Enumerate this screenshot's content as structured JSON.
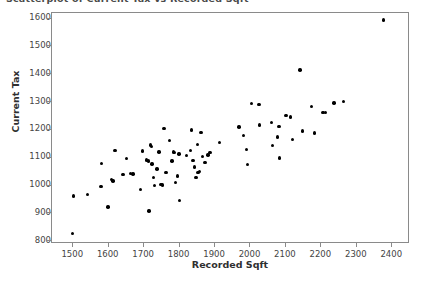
{
  "chart_data": {
    "type": "scatter",
    "title": "Scatterplot of Current Tax vs Recorded Sqft",
    "xlabel": "Recorded Sqft",
    "ylabel": "Current Tax",
    "xlim": [
      1440,
      2450
    ],
    "ylim": [
      790,
      1620
    ],
    "xticks": [
      1500,
      1600,
      1700,
      1800,
      1900,
      2000,
      2100,
      2200,
      2300,
      2400
    ],
    "yticks": [
      800,
      900,
      1000,
      1100,
      1200,
      1300,
      1400,
      1500,
      1600
    ],
    "grid": false,
    "legend": false,
    "marker": "filled-circle",
    "marker_color": "#000000",
    "points": [
      {
        "x": 1498,
        "y": 827
      },
      {
        "x": 1500,
        "y": 962
      },
      {
        "x": 1540,
        "y": 968
      },
      {
        "x": 1578,
        "y": 996
      },
      {
        "x": 1580,
        "y": 1080
      },
      {
        "x": 1598,
        "y": 923
      },
      {
        "x": 1608,
        "y": 1022
      },
      {
        "x": 1612,
        "y": 1016
      },
      {
        "x": 1618,
        "y": 1125
      },
      {
        "x": 1640,
        "y": 1040
      },
      {
        "x": 1650,
        "y": 1098
      },
      {
        "x": 1662,
        "y": 1044
      },
      {
        "x": 1668,
        "y": 1042
      },
      {
        "x": 1690,
        "y": 986
      },
      {
        "x": 1696,
        "y": 1124
      },
      {
        "x": 1706,
        "y": 1092
      },
      {
        "x": 1712,
        "y": 1088
      },
      {
        "x": 1714,
        "y": 909
      },
      {
        "x": 1718,
        "y": 1146
      },
      {
        "x": 1720,
        "y": 1140
      },
      {
        "x": 1722,
        "y": 1078
      },
      {
        "x": 1726,
        "y": 1028
      },
      {
        "x": 1730,
        "y": 1000
      },
      {
        "x": 1736,
        "y": 1060
      },
      {
        "x": 1742,
        "y": 1120
      },
      {
        "x": 1748,
        "y": 1003
      },
      {
        "x": 1752,
        "y": 1002
      },
      {
        "x": 1756,
        "y": 1204
      },
      {
        "x": 1762,
        "y": 1048
      },
      {
        "x": 1772,
        "y": 1162
      },
      {
        "x": 1778,
        "y": 1088
      },
      {
        "x": 1782,
        "y": 1120
      },
      {
        "x": 1786,
        "y": 1118
      },
      {
        "x": 1788,
        "y": 1012
      },
      {
        "x": 1794,
        "y": 1034
      },
      {
        "x": 1798,
        "y": 1114
      },
      {
        "x": 1800,
        "y": 947
      },
      {
        "x": 1820,
        "y": 1108
      },
      {
        "x": 1830,
        "y": 1126
      },
      {
        "x": 1834,
        "y": 1199
      },
      {
        "x": 1838,
        "y": 1090
      },
      {
        "x": 1842,
        "y": 1066
      },
      {
        "x": 1846,
        "y": 1030
      },
      {
        "x": 1850,
        "y": 1148
      },
      {
        "x": 1852,
        "y": 1046
      },
      {
        "x": 1856,
        "y": 1050
      },
      {
        "x": 1860,
        "y": 1190
      },
      {
        "x": 1864,
        "y": 1104
      },
      {
        "x": 1872,
        "y": 1082
      },
      {
        "x": 1880,
        "y": 1110
      },
      {
        "x": 1886,
        "y": 1118
      },
      {
        "x": 1912,
        "y": 1154
      },
      {
        "x": 1968,
        "y": 1210
      },
      {
        "x": 1980,
        "y": 1180
      },
      {
        "x": 1988,
        "y": 1130
      },
      {
        "x": 1992,
        "y": 1076
      },
      {
        "x": 2002,
        "y": 1294
      },
      {
        "x": 2024,
        "y": 1292
      },
      {
        "x": 2026,
        "y": 1218
      },
      {
        "x": 2060,
        "y": 1226
      },
      {
        "x": 2062,
        "y": 1143
      },
      {
        "x": 2076,
        "y": 1174
      },
      {
        "x": 2080,
        "y": 1213
      },
      {
        "x": 2082,
        "y": 1099
      },
      {
        "x": 2100,
        "y": 1252
      },
      {
        "x": 2112,
        "y": 1246
      },
      {
        "x": 2118,
        "y": 1165
      },
      {
        "x": 2140,
        "y": 1415
      },
      {
        "x": 2146,
        "y": 1196
      },
      {
        "x": 2172,
        "y": 1285
      },
      {
        "x": 2180,
        "y": 1189
      },
      {
        "x": 2204,
        "y": 1262
      },
      {
        "x": 2212,
        "y": 1262
      },
      {
        "x": 2236,
        "y": 1296
      },
      {
        "x": 2262,
        "y": 1302
      },
      {
        "x": 2375,
        "y": 1595
      }
    ]
  }
}
